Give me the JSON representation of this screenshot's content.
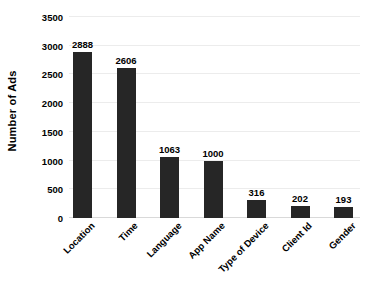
{
  "chart_data": {
    "type": "bar",
    "title": "",
    "subtitle": "",
    "xlabel": "",
    "ylabel": "Number of Ads",
    "categories": [
      "Location",
      "Time",
      "Language",
      "App Name",
      "Type of Device",
      "Client Id",
      "Gender"
    ],
    "values": [
      2888,
      2606,
      1063,
      1000,
      316,
      202,
      193
    ],
    "data_labels": [
      "2888",
      "2606",
      "1063",
      "1000",
      "316",
      "202",
      "193"
    ],
    "ylim": [
      0,
      3500
    ],
    "ytick_values": [
      0,
      500,
      1000,
      1500,
      2000,
      2500,
      3000,
      3500
    ],
    "ytick_labels": [
      "0",
      "500",
      "1000",
      "1500",
      "2000",
      "2500",
      "3000",
      "3500"
    ],
    "grid": true,
    "grid_axis": "y",
    "legend": false,
    "legend_position": "none",
    "bar_color": "#262626",
    "grid_color": "#ececec",
    "axis_color": "#d9d9d9",
    "text_color": "#000000",
    "background": "#ffffff",
    "x_tick_rotation": -45
  }
}
